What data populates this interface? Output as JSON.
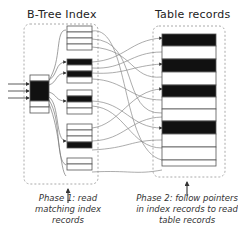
{
  "titles": {
    "index": "B-Tree Index",
    "table": "Table records"
  },
  "captions": {
    "phase1": [
      "Phase 1: read",
      "matching index",
      "records"
    ],
    "phase2": [
      "Phase 2: follow pointers",
      "in index records to read",
      "table records"
    ]
  },
  "colors": {
    "matched": "#111111",
    "record": "#ffffff",
    "border": "#555555",
    "dashed": "#aaaaaa",
    "curve": "#777777"
  },
  "index": {
    "root_node": {
      "x": 29,
      "y": 75,
      "w": 20,
      "rows": 7,
      "matched_rows": [
        1,
        2,
        3
      ]
    },
    "leaf_pages": [
      {
        "y": 27,
        "rows": [
          0,
          0,
          0,
          0,
          1,
          0,
          1,
          0
        ]
      },
      {
        "y": 90,
        "rows": [
          0,
          1,
          0,
          0
        ]
      },
      {
        "y": 120,
        "rows": [
          0,
          0,
          0,
          0,
          1,
          0
        ]
      },
      {
        "y": 160,
        "rows": [
          0,
          0
        ]
      }
    ]
  },
  "table": {
    "rows": [
      1,
      0,
      1,
      0,
      1,
      0,
      0,
      1,
      0,
      0,
      0
    ]
  }
}
